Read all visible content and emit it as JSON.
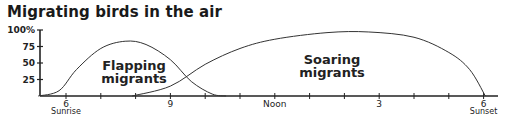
{
  "chart_data": {
    "type": "area",
    "title": "Migrating birds in the air",
    "xlabel": "",
    "ylabel": "",
    "ylim": [
      0,
      100
    ],
    "yticks": [
      "25",
      "50",
      "75",
      "100%"
    ],
    "x_ticks": [
      {
        "hour": 6,
        "label": "6",
        "sublabel": "Sunrise"
      },
      {
        "hour": 9,
        "label": "9",
        "sublabel": ""
      },
      {
        "hour": 12,
        "label": "Noon",
        "sublabel": ""
      },
      {
        "hour": 15,
        "label": "3",
        "sublabel": ""
      },
      {
        "hour": 18,
        "label": "6",
        "sublabel": "Sunset"
      }
    ],
    "grid": false,
    "legend": "inline labels",
    "series": [
      {
        "name": "Flapping migrants",
        "label_line1": "Flapping",
        "label_line2": "migrants",
        "points": [
          [
            5.2,
            0
          ],
          [
            5.8,
            8
          ],
          [
            6.3,
            40
          ],
          [
            7,
            72
          ],
          [
            7.7,
            83
          ],
          [
            8.3,
            78
          ],
          [
            9,
            55
          ],
          [
            9.6,
            22
          ],
          [
            10.2,
            3
          ],
          [
            10.6,
            0
          ]
        ]
      },
      {
        "name": "Soaring migrants",
        "label_line1": "Soaring",
        "label_line2": "migrants",
        "points": [
          [
            7.9,
            0
          ],
          [
            9,
            15
          ],
          [
            10,
            48
          ],
          [
            11,
            72
          ],
          [
            12,
            86
          ],
          [
            13.5,
            96
          ],
          [
            14.7,
            97
          ],
          [
            16,
            89
          ],
          [
            17,
            66
          ],
          [
            17.6,
            40
          ],
          [
            18.05,
            0
          ]
        ]
      }
    ]
  }
}
